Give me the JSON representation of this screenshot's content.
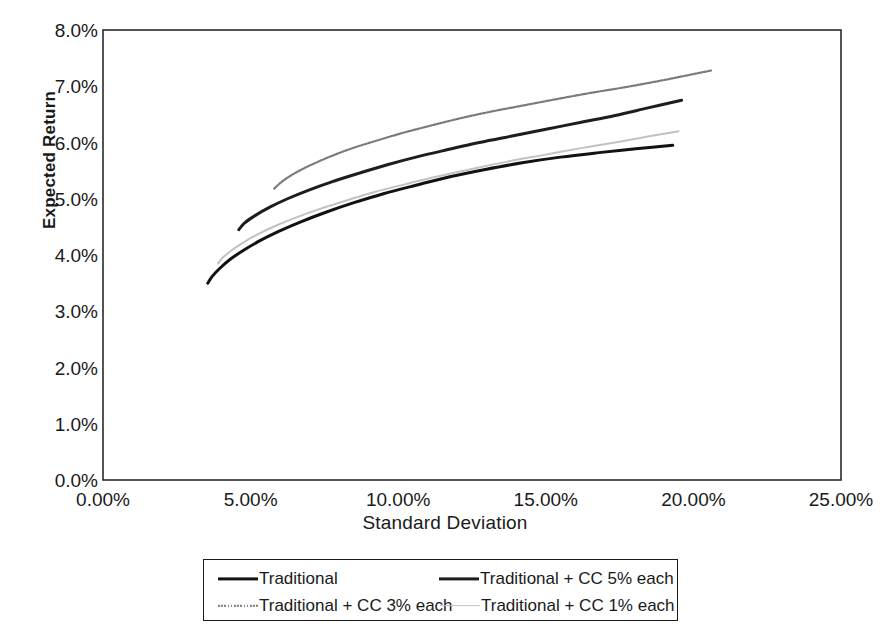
{
  "chart_data": {
    "type": "line",
    "title": "",
    "xlabel": "Standard Deviation",
    "ylabel": "Expected Return",
    "xlim": [
      0,
      25
    ],
    "ylim": [
      0,
      8
    ],
    "x_tick_labels": [
      "0.00%",
      "5.00%",
      "10.00%",
      "15.00%",
      "20.00%",
      "25.00%"
    ],
    "x_tick_values": [
      0,
      5,
      10,
      15,
      20,
      25
    ],
    "y_tick_labels": [
      "0.0%",
      "1.0%",
      "2.0%",
      "3.0%",
      "4.0%",
      "5.0%",
      "6.0%",
      "7.0%",
      "8.0%"
    ],
    "y_tick_values": [
      0,
      1,
      2,
      3,
      4,
      5,
      6,
      7,
      8
    ],
    "grid": false,
    "legend_position": "below-plot",
    "units": "percent",
    "series": [
      {
        "name": "Traditional",
        "color": "#121212",
        "style": "solid",
        "width": 3.0,
        "points": [
          [
            3.55,
            3.5
          ],
          [
            3.7,
            3.62
          ],
          [
            3.95,
            3.76
          ],
          [
            4.3,
            3.92
          ],
          [
            4.75,
            4.08
          ],
          [
            5.3,
            4.25
          ],
          [
            5.95,
            4.42
          ],
          [
            6.7,
            4.59
          ],
          [
            7.55,
            4.76
          ],
          [
            8.5,
            4.93
          ],
          [
            9.5,
            5.09
          ],
          [
            10.6,
            5.24
          ],
          [
            11.75,
            5.39
          ],
          [
            12.95,
            5.52
          ],
          [
            14.2,
            5.64
          ],
          [
            15.5,
            5.74
          ],
          [
            16.8,
            5.82
          ],
          [
            18.05,
            5.89
          ],
          [
            19.3,
            5.95
          ]
        ]
      },
      {
        "name": "Traditional + CC 5% each",
        "color": "#1d1d1d",
        "style": "solid",
        "width": 3.0,
        "points": [
          [
            4.6,
            4.45
          ],
          [
            4.8,
            4.57
          ],
          [
            5.15,
            4.7
          ],
          [
            5.65,
            4.85
          ],
          [
            6.25,
            5.0
          ],
          [
            6.95,
            5.15
          ],
          [
            7.75,
            5.3
          ],
          [
            8.65,
            5.45
          ],
          [
            9.6,
            5.6
          ],
          [
            10.6,
            5.74
          ],
          [
            11.65,
            5.87
          ],
          [
            12.75,
            6.0
          ],
          [
            13.9,
            6.12
          ],
          [
            15.05,
            6.24
          ],
          [
            16.2,
            6.36
          ],
          [
            17.35,
            6.48
          ],
          [
            18.5,
            6.62
          ],
          [
            19.6,
            6.75
          ]
        ]
      },
      {
        "name": "Traditional + CC 3% each",
        "color": "#7b7b7b",
        "style": "dotted",
        "width": 2.2,
        "points": [
          [
            5.8,
            5.18
          ],
          [
            6.05,
            5.3
          ],
          [
            6.45,
            5.44
          ],
          [
            7.0,
            5.59
          ],
          [
            7.65,
            5.74
          ],
          [
            8.4,
            5.89
          ],
          [
            9.25,
            6.03
          ],
          [
            10.15,
            6.17
          ],
          [
            11.1,
            6.3
          ],
          [
            12.1,
            6.43
          ],
          [
            13.15,
            6.55
          ],
          [
            14.25,
            6.66
          ],
          [
            15.35,
            6.77
          ],
          [
            16.5,
            6.88
          ],
          [
            17.65,
            6.98
          ],
          [
            18.8,
            7.09
          ],
          [
            19.75,
            7.19
          ],
          [
            20.6,
            7.28
          ]
        ]
      },
      {
        "name": "Traditional + CC 1% each",
        "color": "#c2c2c2",
        "style": "solid",
        "width": 2.0,
        "points": [
          [
            3.9,
            3.85
          ],
          [
            4.05,
            3.95
          ],
          [
            4.35,
            4.08
          ],
          [
            4.75,
            4.22
          ],
          [
            5.25,
            4.37
          ],
          [
            5.85,
            4.52
          ],
          [
            6.55,
            4.67
          ],
          [
            7.35,
            4.82
          ],
          [
            8.25,
            4.97
          ],
          [
            9.2,
            5.12
          ],
          [
            10.25,
            5.26
          ],
          [
            11.35,
            5.4
          ],
          [
            12.5,
            5.53
          ],
          [
            13.7,
            5.66
          ],
          [
            14.95,
            5.78
          ],
          [
            16.2,
            5.9
          ],
          [
            17.45,
            6.01
          ],
          [
            18.5,
            6.11
          ],
          [
            19.5,
            6.2
          ]
        ]
      }
    ]
  },
  "axes": {
    "y_title": "Expected Return",
    "x_title": "Standard Deviation"
  },
  "legend": {
    "rows": [
      [
        {
          "label": "Traditional",
          "swatch": "sw-traditional"
        },
        {
          "label": "Traditional + CC 5% each",
          "swatch": "sw-cc5"
        }
      ],
      [
        {
          "label": "Traditional + CC 3% each",
          "swatch": "sw-cc3"
        },
        {
          "label": "Traditional + CC 1% each",
          "swatch": "sw-cc1"
        }
      ]
    ]
  },
  "colors": {
    "frame": "#2a2a2a",
    "background": "#ffffff",
    "text": "#1a1a1a"
  }
}
